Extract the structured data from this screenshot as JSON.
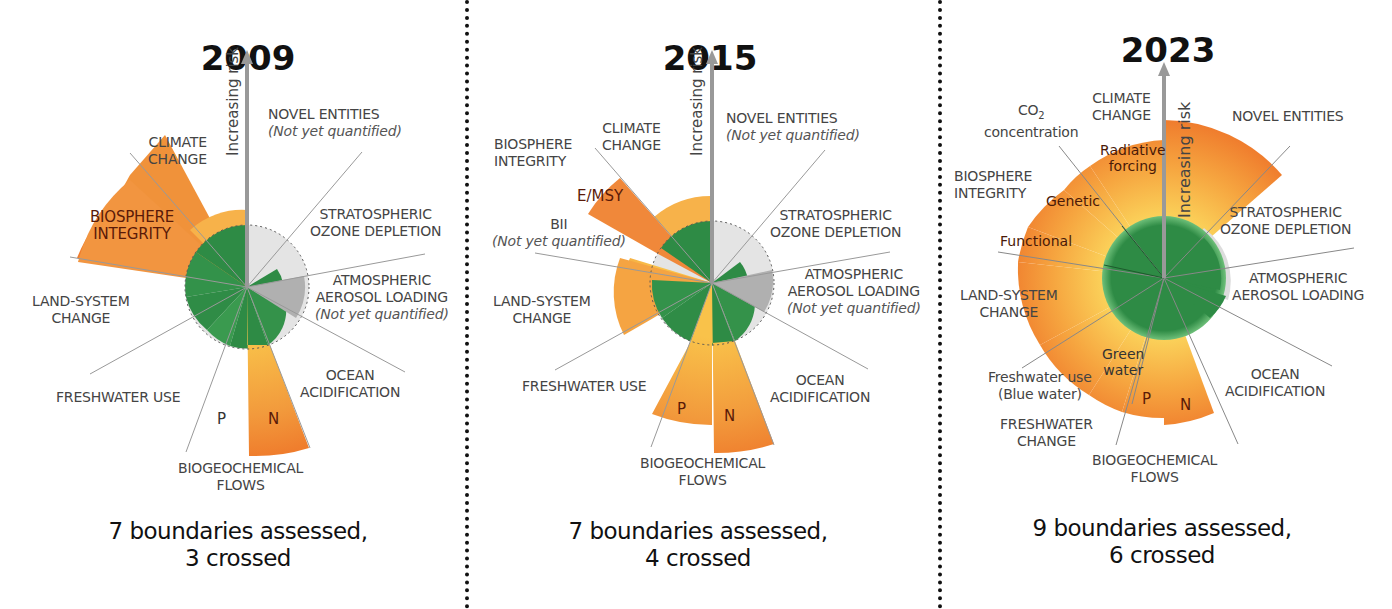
{
  "panels": [
    {
      "year": "2009",
      "summary_line1": "7 boundaries assessed,",
      "summary_line2": "3 crossed",
      "axis_label": "Increasing risk",
      "safe_space_label": "Safe operating space",
      "labels": {
        "novel_entities": "NOVEL ENTITIES",
        "novel_entities_note": "(Not yet quantified)",
        "climate_change_1": "CLIMATE",
        "climate_change_2": "CHANGE",
        "biosphere_1": "BIOSPHERE",
        "biosphere_2": "INTEGRITY",
        "ozone_1": "STRATOSPHERIC",
        "ozone_2": "OZONE DEPLETION",
        "aerosol_1": "ATMOSPHERIC",
        "aerosol_2": "AEROSOL LOADING",
        "aerosol_note": "(Not yet quantified)",
        "land_1": "LAND-SYSTEM",
        "land_2": "CHANGE",
        "freshwater": "FRESHWATER USE",
        "ocean_1": "OCEAN",
        "ocean_2": "ACIDIFICATION",
        "biogeo_1": "BIOGEOCHEMICAL",
        "biogeo_2": "FLOWS",
        "p": "P",
        "n": "N"
      }
    },
    {
      "year": "2015",
      "summary_line1": "7 boundaries assessed,",
      "summary_line2": "4 crossed",
      "axis_label": "Increasing risk",
      "safe_space_label": "Safe operating space",
      "labels": {
        "novel_entities": "NOVEL ENTITIES",
        "novel_entities_note": "(Not yet quantified)",
        "climate_change_1": "CLIMATE",
        "climate_change_2": "CHANGE",
        "biosphere_1": "BIOSPHERE",
        "biosphere_2": "INTEGRITY",
        "emsy": "E/MSY",
        "bii": "BII",
        "bii_note": "(Not yet quantified)",
        "ozone_1": "STRATOSPHERIC",
        "ozone_2": "OZONE DEPLETION",
        "aerosol_1": "ATMOSPHERIC",
        "aerosol_2": "AEROSOL LOADING",
        "aerosol_note": "(Not yet quantified)",
        "land_1": "LAND-SYSTEM",
        "land_2": "CHANGE",
        "freshwater": "FRESHWATER USE",
        "ocean_1": "OCEAN",
        "ocean_2": "ACIDIFICATION",
        "biogeo_1": "BIOGEOCHEMICAL",
        "biogeo_2": "FLOWS",
        "p": "P",
        "n": "N"
      }
    },
    {
      "year": "2023",
      "summary_line1": "9 boundaries assessed,",
      "summary_line2": "6 crossed",
      "axis_label": "Increasing risk",
      "safe_space_label": "Safe operating space",
      "labels": {
        "climate_change_1": "CLIMATE",
        "climate_change_2": "CHANGE",
        "co2_1": "CO",
        "co2_sub": "2",
        "co2_2": "concentration",
        "radiative_1": "Radiative",
        "radiative_2": "forcing",
        "novel_entities": "NOVEL ENTITIES",
        "biosphere_1": "BIOSPHERE",
        "biosphere_2": "INTEGRITY",
        "genetic": "Genetic",
        "functional": "Functional",
        "ozone_1": "STRATOSPHERIC",
        "ozone_2": "OZONE DEPLETION",
        "aerosol_1": "ATMOSPHERIC",
        "aerosol_2": "AEROSOL LOADING",
        "land_1": "LAND-SYSTEM",
        "land_2": "CHANGE",
        "green_1": "Green",
        "green_2": "water",
        "blue_1": "Freshwater use",
        "blue_2": "(Blue water)",
        "freshwater_1": "FRESHWATER",
        "freshwater_2": "CHANGE",
        "ocean_1": "OCEAN",
        "ocean_2": "ACIDIFICATION",
        "biogeo_1": "BIOGEOCHEMICAL",
        "biogeo_2": "FLOWS",
        "p": "P",
        "n": "N"
      }
    }
  ],
  "colors": {
    "safe_green": "#2e8b45",
    "zone_yellow": "#f7b84a",
    "zone_orange": "#f28a3a",
    "high_risk": "#e8501f",
    "not_quantified": "#c9c9c9",
    "divider": "#111111"
  }
}
